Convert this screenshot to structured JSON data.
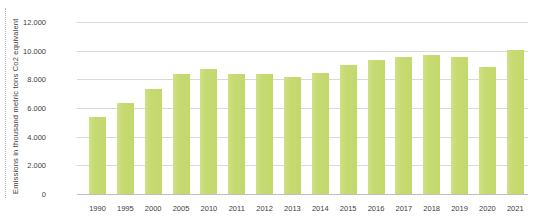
{
  "chart": {
    "ylabel": "Emissions in thousand metric tons Co2 equivalent"
  },
  "chart_data": {
    "type": "bar",
    "title": "",
    "xlabel": "",
    "ylabel": "Emissions in thousand metric tons Co2 equivalent",
    "categories": [
      "1990",
      "1995",
      "2000",
      "2005",
      "2010",
      "2011",
      "2012",
      "2013",
      "2014",
      "2015",
      "2016",
      "2017",
      "2018",
      "2019",
      "2020",
      "2021"
    ],
    "values": [
      5350,
      6330,
      7320,
      8400,
      8730,
      8340,
      8340,
      8160,
      8450,
      9000,
      9380,
      9580,
      9720,
      9540,
      8890,
      10070
    ],
    "ylim": [
      0,
      12000
    ],
    "ytick_values": [
      0,
      2000,
      4000,
      6000,
      8000,
      10000,
      12000
    ],
    "ytick_labels": [
      "0",
      "2.000",
      "4.000",
      "6.000",
      "8.000",
      "10.000",
      "12.000"
    ],
    "grid": true,
    "legend": false,
    "bar_color": "#c6da72",
    "gridline_color": "#d9d9d9",
    "axis_line_color": "#bfbfbf",
    "text_color": "#404040"
  }
}
